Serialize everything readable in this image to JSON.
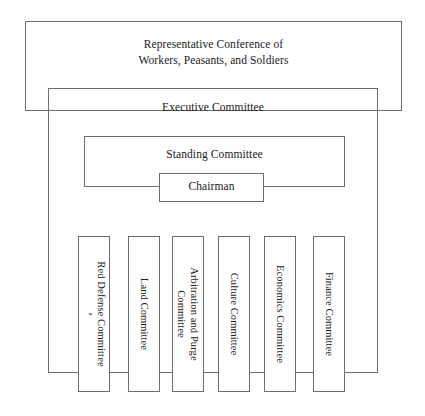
{
  "diagram": {
    "title_text": "Organizational chart",
    "conference": {
      "line1": "Representative Conference of",
      "line2": "Workers, Peasants, and Soldiers"
    },
    "executive": {
      "label": "Executive Committee"
    },
    "standing": {
      "label": "Standing Committee"
    },
    "chairman": {
      "label": "Chairman"
    },
    "committees": [
      {
        "line1": "Red Defense  Committee",
        "line2": "",
        "footnote": "a"
      },
      {
        "line1": "Land Committee",
        "line2": "",
        "footnote": ""
      },
      {
        "line1": "Arbitration and Purge",
        "line2": "Committee",
        "footnote": ""
      },
      {
        "line1": "Culture Committee",
        "line2": "",
        "footnote": ""
      },
      {
        "line1": "Economics Committee",
        "line2": "",
        "footnote": ""
      },
      {
        "line1": "Finance Committee",
        "line2": "",
        "footnote": ""
      }
    ],
    "colors": {
      "line": "#6e6e6e",
      "text": "#1a1a1a",
      "background": "#ffffff"
    }
  }
}
